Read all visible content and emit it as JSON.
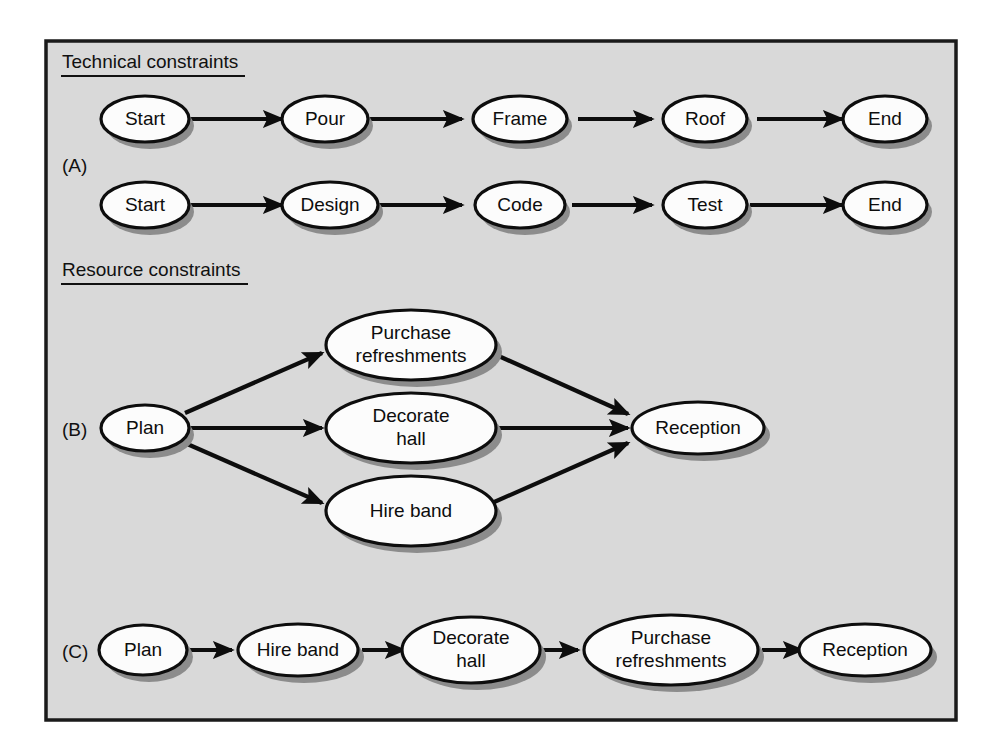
{
  "figure": {
    "panel": {
      "background_color": "#d9d9d9",
      "border_color": "#1a1a1a"
    },
    "headings": [
      {
        "id": "technical",
        "text": "Technical constraints"
      },
      {
        "id": "resource",
        "text": "Resource constraints"
      }
    ],
    "section_labels": [
      {
        "id": "a",
        "text": "(A)"
      },
      {
        "id": "b",
        "text": "(B)"
      },
      {
        "id": "c",
        "text": "(C)"
      }
    ],
    "sections": {
      "a": {
        "label": "(A)",
        "heading": "Technical constraints",
        "rows": [
          {
            "id": "construction",
            "nodes": [
              {
                "id": "a1-start",
                "label": "Start"
              },
              {
                "id": "a1-pour",
                "label": "Pour"
              },
              {
                "id": "a1-frame",
                "label": "Frame"
              },
              {
                "id": "a1-roof",
                "label": "Roof"
              },
              {
                "id": "a1-end",
                "label": "End"
              }
            ],
            "edges": [
              {
                "from": "a1-start",
                "to": "a1-pour"
              },
              {
                "from": "a1-pour",
                "to": "a1-frame"
              },
              {
                "from": "a1-frame",
                "to": "a1-roof"
              },
              {
                "from": "a1-roof",
                "to": "a1-end"
              }
            ]
          },
          {
            "id": "software",
            "nodes": [
              {
                "id": "a2-start",
                "label": "Start"
              },
              {
                "id": "a2-design",
                "label": "Design"
              },
              {
                "id": "a2-code",
                "label": "Code"
              },
              {
                "id": "a2-test",
                "label": "Test"
              },
              {
                "id": "a2-end",
                "label": "End"
              }
            ],
            "edges": [
              {
                "from": "a2-start",
                "to": "a2-design"
              },
              {
                "from": "a2-design",
                "to": "a2-code"
              },
              {
                "from": "a2-code",
                "to": "a2-test"
              },
              {
                "from": "a2-test",
                "to": "a2-end"
              }
            ]
          }
        ]
      },
      "b": {
        "label": "(B)",
        "heading": "Resource constraints",
        "nodes": [
          {
            "id": "b-plan",
            "label": "Plan"
          },
          {
            "id": "b-purchase",
            "label": "Purchase refreshments",
            "line1": "Purchase",
            "line2": "refreshments"
          },
          {
            "id": "b-decorate",
            "label": "Decorate hall",
            "line1": "Decorate",
            "line2": "hall"
          },
          {
            "id": "b-hire",
            "label": "Hire band"
          },
          {
            "id": "b-reception",
            "label": "Reception"
          }
        ],
        "edges": [
          {
            "from": "b-plan",
            "to": "b-purchase"
          },
          {
            "from": "b-plan",
            "to": "b-decorate"
          },
          {
            "from": "b-plan",
            "to": "b-hire"
          },
          {
            "from": "b-purchase",
            "to": "b-reception"
          },
          {
            "from": "b-decorate",
            "to": "b-reception"
          },
          {
            "from": "b-hire",
            "to": "b-reception"
          }
        ]
      },
      "c": {
        "label": "(C)",
        "nodes": [
          {
            "id": "c-plan",
            "label": "Plan"
          },
          {
            "id": "c-hire",
            "label": "Hire band"
          },
          {
            "id": "c-decorate",
            "label": "Decorate hall",
            "line1": "Decorate",
            "line2": "hall"
          },
          {
            "id": "c-purchase",
            "label": "Purchase refreshments",
            "line1": "Purchase",
            "line2": "refreshments"
          },
          {
            "id": "c-reception",
            "label": "Reception"
          }
        ],
        "edges": [
          {
            "from": "c-plan",
            "to": "c-hire"
          },
          {
            "from": "c-hire",
            "to": "c-decorate"
          },
          {
            "from": "c-decorate",
            "to": "c-purchase"
          },
          {
            "from": "c-purchase",
            "to": "c-reception"
          }
        ]
      }
    }
  }
}
